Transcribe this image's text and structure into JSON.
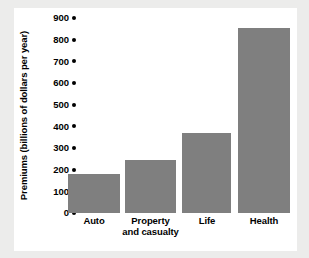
{
  "chart_data": {
    "type": "bar",
    "title": "",
    "xlabel": "",
    "ylabel": "Premiums (billions of dollars per year)",
    "categories": [
      "Auto",
      "Property and casualty",
      "Life",
      "Health"
    ],
    "values": [
      180,
      245,
      370,
      855
    ],
    "ylim": [
      0,
      900
    ],
    "ytick_labels": [
      "900",
      "800",
      "700",
      "600",
      "500",
      "400",
      "300",
      "200",
      "100",
      "0"
    ],
    "ytick_values": [
      900,
      800,
      700,
      600,
      500,
      400,
      300,
      200,
      100,
      0
    ],
    "grid": false,
    "legend": null,
    "bar_color": "#7f7f7f",
    "axis_color": "#000000",
    "panel_color": "#ffffff",
    "figure_color": "#ececeb"
  },
  "axes": {
    "y_title": "Premiums (billions of dollars per year)",
    "x_labels": [
      {
        "line1": "Auto",
        "line2": ""
      },
      {
        "line1": "Property",
        "line2": "and casualty"
      },
      {
        "line1": "Life",
        "line2": ""
      },
      {
        "line1": "Health",
        "line2": ""
      }
    ]
  }
}
